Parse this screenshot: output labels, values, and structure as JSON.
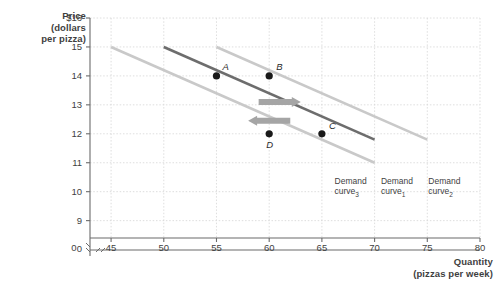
{
  "chart_data": {
    "type": "line",
    "title": "",
    "xlabel": "Quantity",
    "xlabel_sub": "(pizzas per week)",
    "ylabel": "Price",
    "ylabel_sub_1": "(dollars",
    "ylabel_sub_2": "per pizza)",
    "xlim": [
      43,
      80
    ],
    "ylim": [
      8.4,
      16
    ],
    "grid": true,
    "legend": "none",
    "x_ticks": [
      "0",
      "45",
      "50",
      "55",
      "60",
      "65",
      "70",
      "75",
      "80"
    ],
    "x_tick_values": [
      43,
      45,
      50,
      55,
      60,
      65,
      70,
      75,
      80
    ],
    "y_ticks": [
      "$16",
      "15",
      "14",
      "13",
      "12",
      "11",
      "10",
      "9",
      "0"
    ],
    "y_tick_values": [
      16,
      15,
      14,
      13,
      12,
      11,
      10,
      9,
      8.4
    ],
    "axis_break_x": true,
    "axis_break_y": true,
    "series": [
      {
        "name": "Demand curve 3",
        "label_line1": "Demand",
        "label_line2": "curve",
        "label_sub": "3",
        "color": "#c9c9c9",
        "x": [
          45,
          70
        ],
        "y": [
          15,
          11
        ]
      },
      {
        "name": "Demand curve 1",
        "label_line1": "Demand",
        "label_line2": "curve",
        "label_sub": "1",
        "color": "#6d6d6d",
        "x": [
          50,
          70
        ],
        "y": [
          15,
          11.8
        ]
      },
      {
        "name": "Demand curve 2",
        "label_line1": "Demand",
        "label_line2": "curve",
        "label_sub": "2",
        "color": "#c9c9c9",
        "x": [
          55,
          75
        ],
        "y": [
          15,
          11.8
        ]
      }
    ],
    "points": [
      {
        "label": "A",
        "x": 55,
        "y": 14,
        "on_curve": "Demand curve 1"
      },
      {
        "label": "B",
        "x": 60,
        "y": 14,
        "on_curve": "Demand curve 2"
      },
      {
        "label": "C",
        "x": 65,
        "y": 12,
        "on_curve": "Demand curve 1"
      },
      {
        "label": "D",
        "x": 60,
        "y": 12,
        "on_curve": "Demand curve 3"
      }
    ],
    "annotations": [
      {
        "type": "arrow",
        "direction": "right",
        "x_from": 59,
        "x_to": 63,
        "y": 13.1,
        "color": "#a5a5a5"
      },
      {
        "type": "arrow",
        "direction": "left",
        "x_from": 62,
        "x_to": 58,
        "y": 12.45,
        "color": "#a5a5a5"
      }
    ]
  },
  "colors": {
    "axis": "#6b6b6b",
    "grid": "#d6d6d6",
    "text": "#3f3f3f",
    "dark_curve": "#6d6d6d",
    "light_curve": "#c9c9c9",
    "arrow": "#a5a5a5",
    "point": "#1a1a1a",
    "background": "#ffffff"
  }
}
